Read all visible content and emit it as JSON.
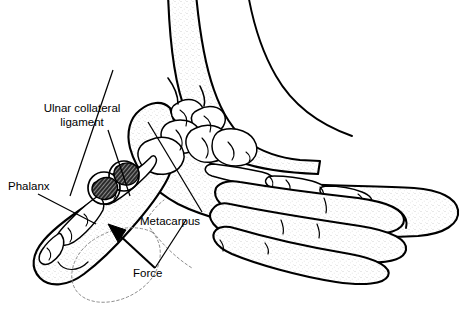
{
  "figure": {
    "style": "black-and-white-line-drawing-with-stipple-shading",
    "background_color": "#ffffff",
    "line_color": "#000000",
    "stipple_color": "#b8b8b8",
    "ghost_color": "#8d8d8d"
  },
  "labels": {
    "ulnar_collateral_ligament": {
      "line1": "Ulnar collateral",
      "line2": "ligament",
      "alignment": "centered",
      "x": 82,
      "y1": 112,
      "y2": 126
    },
    "phalanx": {
      "text": "Phalanx",
      "alignment": "start",
      "x": 8,
      "y": 190
    },
    "metacarpus": {
      "text": "Metacarpus",
      "alignment": "start",
      "x": 140,
      "y": 225
    },
    "force": {
      "text": "Force",
      "alignment": "start",
      "x": 133,
      "y": 277
    }
  },
  "annotations": {
    "ligament_leader_label": "leader-line-ulnar-collateral-ligament",
    "phalanx_leader_label": "leader-line-phalanx",
    "metacarpus_leader_label": "leader-line-metacarpus",
    "force_leader_label": "leader-line-force",
    "force_arrow_label": "force-direction-arrow",
    "ghost_outline_label": "displaced-thumb-ghost-outline"
  },
  "structures": {
    "forearm": "forearm-and-wrist",
    "palm": "palm-and-hand-dorsum",
    "thumb": "thumb-soft-tissue",
    "carpals": "carpal-bones-cluster",
    "metacarpal_bone": "first-metacarpal-bone",
    "proximal_phalanx": "thumb-proximal-phalanx",
    "distal_phalanx": "thumb-distal-phalanx",
    "index_phalanges": "index-finger-phalanges",
    "ligament_bundle_a": "torn-ulnar-collateral-ligament-bundle-proximal",
    "ligament_bundle_b": "torn-ulnar-collateral-ligament-bundle-distal",
    "fingers": [
      "index-finger",
      "middle-finger",
      "ring-finger",
      "little-finger"
    ]
  }
}
